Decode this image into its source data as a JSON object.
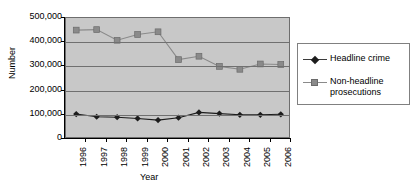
{
  "chart_data": {
    "type": "line",
    "title": "",
    "xlabel": "Year",
    "ylabel": "Number",
    "categories": [
      "1996",
      "1997",
      "1998",
      "1999",
      "2000",
      "2001",
      "2002",
      "2003",
      "2004",
      "2005",
      "2006"
    ],
    "ylim": [
      0,
      500000
    ],
    "ytick_values": [
      0,
      100000,
      200000,
      300000,
      400000,
      500000
    ],
    "ytick_labels": [
      "0",
      "100,000",
      "200,000",
      "300,000",
      "400,000",
      "500,000"
    ],
    "grid": true,
    "legend_position": "right",
    "plot_background": "#c8c8c8",
    "series": [
      {
        "name": "Headline crime",
        "marker": "diamond",
        "color": "#1c1c1c",
        "values": [
          103000,
          92000,
          90000,
          85000,
          78000,
          88000,
          110000,
          105000,
          100000,
          100000,
          102000
        ]
      },
      {
        "name": "Non-headline prosecutions",
        "marker": "square",
        "color": "#8a8a8a",
        "values": [
          450000,
          452000,
          408000,
          432000,
          443000,
          328000,
          342000,
          300000,
          288000,
          310000,
          308000
        ]
      }
    ]
  },
  "legend": {
    "entries": [
      {
        "label": "Headline crime"
      },
      {
        "label": "Non-headline prosecutions"
      }
    ]
  }
}
